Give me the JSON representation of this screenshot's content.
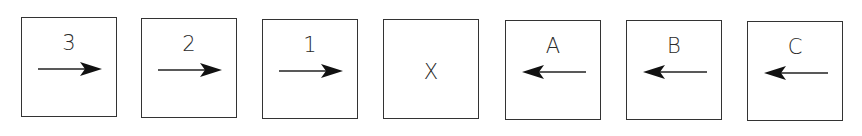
{
  "diagram": {
    "boxes": [
      {
        "label": "3",
        "arrow": "right"
      },
      {
        "label": "2",
        "arrow": "right"
      },
      {
        "label": "1",
        "arrow": "right"
      },
      {
        "label": "X",
        "arrow": "none"
      },
      {
        "label": "A",
        "arrow": "left"
      },
      {
        "label": "B",
        "arrow": "left"
      },
      {
        "label": "C",
        "arrow": "left"
      }
    ],
    "colors": {
      "stroke": "#333333",
      "text": "#2a2a2a",
      "background": "#ffffff"
    }
  }
}
